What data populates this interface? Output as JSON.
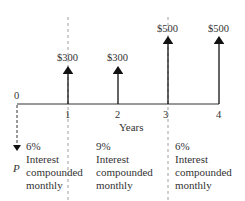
{
  "diagram": {
    "type": "cash-flow diagram",
    "axis_label": "Years",
    "origin_label": "0",
    "ticks": [
      "1",
      "2",
      "3",
      "4"
    ],
    "present_value_label": "P",
    "cash_flows": [
      {
        "year": 1,
        "label": "$300"
      },
      {
        "year": 2,
        "label": "$300"
      },
      {
        "year": 3,
        "label": "$500"
      },
      {
        "year": 4,
        "label": "$500"
      }
    ],
    "periods": [
      {
        "rate": "6%",
        "line1": "Interest",
        "line2": "compounded",
        "line3": "monthly"
      },
      {
        "rate": "9%",
        "line1": "Interest",
        "line2": "compounded",
        "line3": "monthly"
      },
      {
        "rate": "6%",
        "line1": "Interest",
        "line2": "compounded",
        "line3": "monthly"
      }
    ]
  }
}
